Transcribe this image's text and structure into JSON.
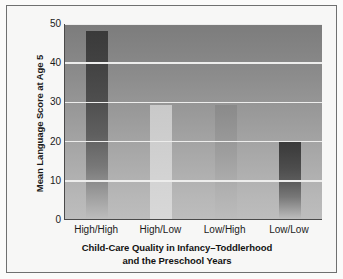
{
  "chart_data": {
    "type": "bar",
    "title": "",
    "subtitle": "",
    "categories": [
      "High/High",
      "High/Low",
      "Low/High",
      "Low/Low"
    ],
    "values": [
      48,
      29,
      29,
      20
    ],
    "xlabel": "Child-Care Quality in Infancy–Toddlerhood and the Preschool Years",
    "xlabel_line1": "Child-Care Quality in Infancy–Toddlerhood",
    "xlabel_line2": "and the Preschool Years",
    "ylabel": "Mean Language Score at Age 5",
    "ylim": [
      0,
      50
    ],
    "yticks": [
      0,
      10,
      20,
      30,
      40,
      50
    ],
    "ytick_labels": [
      "0",
      "10",
      "20",
      "30",
      "40",
      "50"
    ],
    "gridlines": [
      10,
      20,
      30,
      40,
      50
    ],
    "grid": true,
    "legend": false,
    "legend_position": "none",
    "bar_styles": [
      "dark",
      "light",
      "mid",
      "dark"
    ],
    "colors": {
      "grid": "#ededec",
      "axis": "#4a4a4a",
      "text": "#1b1b1b",
      "plot_background_top": "#7c7c7c",
      "plot_background_bottom": "#bdbdbd",
      "bar_dark_top": "#3a3a3a",
      "bar_light_top": "#c9c9c9",
      "frame": "#6f7070",
      "page_background": "#ffffff"
    }
  }
}
